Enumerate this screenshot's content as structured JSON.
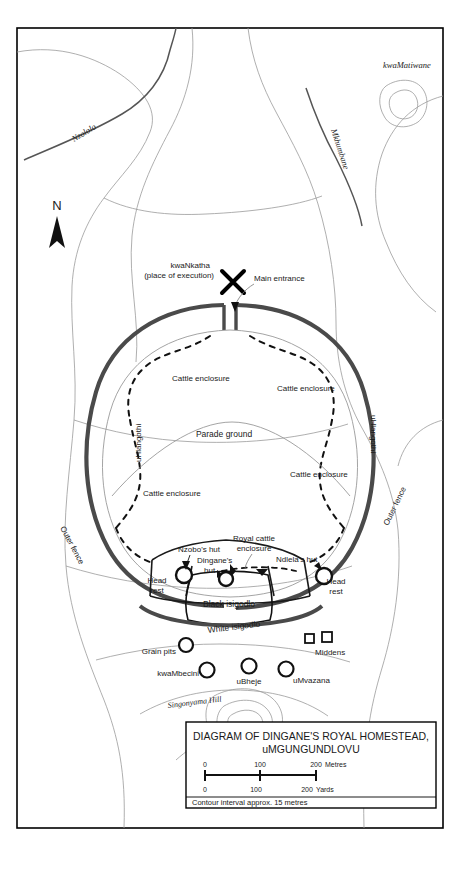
{
  "title_block": {
    "line1": "DIAGRAM OF DINGANE'S ROYAL HOMESTEAD,",
    "line2": "uMGUNGUNDLOVU",
    "scale_metres": {
      "ticks": [
        "0",
        "100",
        "200"
      ],
      "unit": "Metres"
    },
    "scale_yards": {
      "ticks": [
        "0",
        "100",
        "200"
      ],
      "unit": "Yards"
    },
    "contour_note": "Contour interval approx. 15 metres"
  },
  "compass": {
    "label": "N"
  },
  "terrain": {
    "rivers": [
      {
        "name": "Nzololo"
      },
      {
        "name": "Mkhumbane"
      }
    ],
    "hills": [
      {
        "name": "kwaMatiwane"
      },
      {
        "name": "Singonyama Hill"
      }
    ]
  },
  "enclosure": {
    "main_entrance": "Main entrance",
    "execution_site_line1": "kwaNkatha",
    "execution_site_line2": "(place of execution)",
    "parade_ground": "Parade ground",
    "cattle_enclosures": [
      "Cattle enclosure",
      "Cattle enclosure",
      "Cattle enclosure",
      "Cattle enclosure"
    ],
    "side_left": "uHlangothi",
    "side_right": "uHlangothi",
    "outer_fence_left": "Outer fence",
    "outer_fence_right": "Outer fence"
  },
  "isigodlo": {
    "royal_cattle_line1": "Royal cattle",
    "royal_cattle_line2": "enclosure",
    "nzobo_hut": "Nzobo's hut",
    "dingane_hut_line1": "Dingane's",
    "dingane_hut_line2": "hut",
    "ndlela_hut": "Ndlela's hut",
    "head_rest_left_line1": "Head",
    "head_rest_left_line2": "rest",
    "head_rest_right_line1": "Head",
    "head_rest_right_line2": "rest",
    "black_isigodlo": "Black isigodlo",
    "white_isigodlo": "White  isigodlo"
  },
  "outskirts": {
    "grain_pits": "Grain pits",
    "middens": "Middens",
    "huts": [
      "kwaMbecini",
      "uBheje",
      "uMvazana"
    ]
  },
  "colors": {
    "palisade": "#4a4a4a",
    "contour": "#9a9a9a",
    "river": "#555555",
    "border": "#000000",
    "ink": "#1a1a1a"
  }
}
